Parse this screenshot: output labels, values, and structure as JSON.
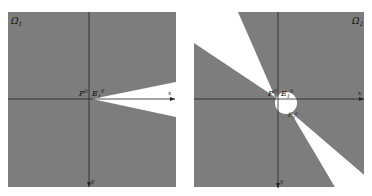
{
  "figure": {
    "panels": [
      {
        "id": "left",
        "region_label": "Ω",
        "region_sub": "1",
        "point_label": "P",
        "point_sup": "0",
        "edge_label": "E",
        "edge_sub": "1",
        "edge_sup": "0",
        "x_axis_label": "x",
        "y_axis_label": "y"
      },
      {
        "id": "right",
        "region_label": "Ω",
        "region_sub": "2",
        "point_label": "P",
        "point_sup": "0",
        "edge_label": "E",
        "edge_sub": "1",
        "edge_sup": "0",
        "edge2_label": "E",
        "edge2_sub": "2",
        "edge2_sup": "0",
        "x_axis_label": "x",
        "y_axis_label": "y"
      }
    ],
    "colors": {
      "fill": "#7d7d7d",
      "background": "#ffffff",
      "axis": "#222222"
    }
  }
}
